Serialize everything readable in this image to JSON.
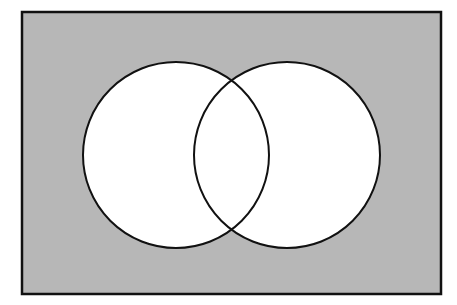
{
  "diagram": {
    "type": "venn",
    "universe": {
      "label": "",
      "x": 22,
      "y": 12,
      "width": 419,
      "height": 282,
      "fill": "#b7b7b7",
      "stroke": "#111111"
    },
    "sets": [
      {
        "id": "A",
        "label": "",
        "cx": 176,
        "cy": 155,
        "r": 93,
        "fill": "#ffffff",
        "stroke": "#111111"
      },
      {
        "id": "B",
        "label": "",
        "cx": 287,
        "cy": 155,
        "r": 93,
        "fill": "#ffffff",
        "stroke": "#111111"
      }
    ],
    "shaded_region": "complement of A ∪ B"
  }
}
